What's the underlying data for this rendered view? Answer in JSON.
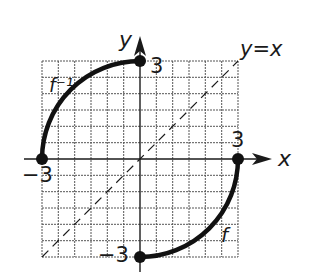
{
  "diagram": {
    "type": "function-inverse-graph",
    "grid": {
      "x_min": -3,
      "x_max": 3,
      "y_min": -3,
      "y_max": 3,
      "cell_units": 0.5
    },
    "axes": {
      "x_label": "x",
      "y_label": "y"
    },
    "line_label": "y=x",
    "curves": [
      {
        "name": "f",
        "label": "f",
        "from": [
          0,
          -3
        ],
        "to": [
          3,
          0
        ]
      },
      {
        "name": "f_inverse",
        "label": "f⁻¹",
        "from": [
          -3,
          0
        ],
        "to": [
          0,
          3
        ]
      }
    ],
    "tick_labels": {
      "y_top": "3",
      "x_right": "3",
      "x_left": "−3",
      "y_bottom": "−3"
    }
  },
  "colors": {
    "ink": "#1a1a1a",
    "grid": "#555555",
    "background": "#ffffff"
  }
}
